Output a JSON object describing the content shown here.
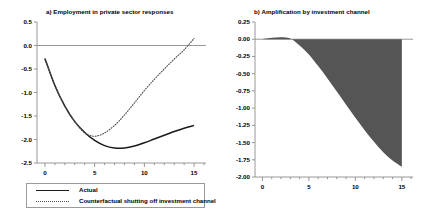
{
  "figure": {
    "background": "#ffffff",
    "axis_color": "#8c8c8c",
    "line_color": "#1a1a1a",
    "dotted_color": "#4d4d4d",
    "fill_color": "#555555"
  },
  "legend": {
    "items": [
      {
        "label": "Actual",
        "style": "solid"
      },
      {
        "label": "Counterfactual shutting off investment channel",
        "style": "dotted"
      }
    ]
  },
  "chart_data": [
    {
      "id": "panel-a",
      "type": "line",
      "title": "a) Employment in private sector responses",
      "xlabel": "",
      "ylabel": "",
      "xlim": [
        -0.8,
        16.2
      ],
      "ylim": [
        -2.5,
        0.5
      ],
      "xticks": [
        0,
        5,
        10,
        15
      ],
      "xtick_labels": [
        "0",
        "5",
        "10",
        "15"
      ],
      "yticks": [
        0.5,
        0.0,
        -0.5,
        -1.0,
        -1.5,
        -2.0,
        -2.5
      ],
      "ytick_labels": [
        "0.5",
        "0.0",
        "-0.5",
        "-1.0",
        "-1.5",
        "-2.0",
        "-2.5"
      ],
      "grid": false,
      "zero_line": true,
      "legend_position": "below",
      "x": [
        0,
        1,
        2,
        3,
        4,
        5,
        6,
        7,
        8,
        9,
        10,
        11,
        12,
        13,
        14,
        15
      ],
      "series": [
        {
          "name": "Actual",
          "style": "solid",
          "values": [
            -0.28,
            -0.85,
            -1.29,
            -1.62,
            -1.85,
            -2.02,
            -2.13,
            -2.18,
            -2.18,
            -2.14,
            -2.07,
            -1.99,
            -1.91,
            -1.83,
            -1.76,
            -1.7
          ]
        },
        {
          "name": "Counterfactual shutting off investment channel",
          "style": "dotted",
          "values": [
            -0.28,
            -0.85,
            -1.29,
            -1.62,
            -1.86,
            -1.93,
            -1.86,
            -1.7,
            -1.48,
            -1.22,
            -0.96,
            -0.72,
            -0.5,
            -0.29,
            -0.09,
            0.15
          ]
        }
      ]
    },
    {
      "id": "panel-b",
      "type": "area",
      "title": "b) Amplification by investment channel",
      "xlabel": "",
      "ylabel": "",
      "xlim": [
        -0.8,
        16.2
      ],
      "ylim": [
        -2.0,
        0.25
      ],
      "xticks": [
        0,
        5,
        10,
        15
      ],
      "xtick_labels": [
        "0",
        "5",
        "10",
        "15"
      ],
      "yticks": [
        0.25,
        0.0,
        -0.25,
        -0.5,
        -0.75,
        -1.0,
        -1.25,
        -1.5,
        -1.75,
        -2.0
      ],
      "ytick_labels": [
        "0.25",
        "0.00",
        "-0.25",
        "-0.50",
        "-0.75",
        "-1.00",
        "-1.25",
        "-1.50",
        "-1.75",
        "-2.00"
      ],
      "grid": false,
      "zero_line": true,
      "legend_position": "none",
      "x": [
        0,
        1,
        2,
        3,
        4,
        5,
        6,
        7,
        8,
        9,
        10,
        11,
        12,
        13,
        14,
        15
      ],
      "series": [
        {
          "name": "Amplification",
          "style": "filled",
          "values": [
            0.0,
            0.02,
            0.03,
            0.01,
            -0.09,
            -0.22,
            -0.39,
            -0.57,
            -0.76,
            -0.95,
            -1.14,
            -1.32,
            -1.49,
            -1.64,
            -1.76,
            -1.85
          ]
        }
      ]
    }
  ]
}
